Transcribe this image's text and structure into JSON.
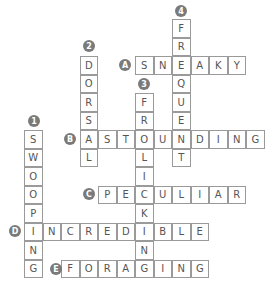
{
  "puzzle": {
    "grid": {
      "origin_x": 24,
      "origin_y": 19,
      "cell_size": 18.5
    },
    "colors": {
      "cell_border": "#9a9a9a",
      "letter": "#555555",
      "badge_bg": "#7a7a7a",
      "badge_text": "#ffffff"
    },
    "down": [
      {
        "label": "1",
        "word": "SWOOPING",
        "col": 0,
        "row": 6,
        "badge": {
          "x": 34,
          "y": 121
        }
      },
      {
        "label": "2",
        "word": "DORSAL",
        "col": 3,
        "row": 2,
        "badge": {
          "x": 89,
          "y": 46
        }
      },
      {
        "label": "3",
        "word": "FROLICKING",
        "col": 6,
        "row": 4,
        "badge": {
          "x": 144,
          "y": 84
        }
      },
      {
        "label": "4",
        "word": "FREQUENT",
        "col": 8,
        "row": 0,
        "badge": {
          "x": 181,
          "y": 11
        }
      }
    ],
    "across": [
      {
        "label": "A",
        "word": "SNEAKY",
        "col": 6,
        "row": 2,
        "badge": {
          "x": 125,
          "y": 65
        }
      },
      {
        "label": "B",
        "word": "ASTOUNDING",
        "col": 3,
        "row": 6,
        "badge": {
          "x": 70,
          "y": 139
        }
      },
      {
        "label": "C",
        "word": "PECULIAR",
        "col": 4,
        "row": 9,
        "badge": {
          "x": 89,
          "y": 194
        }
      },
      {
        "label": "D",
        "word": "INCREDIBLE",
        "col": 0,
        "row": 11,
        "badge": {
          "x": 15,
          "y": 231
        }
      },
      {
        "label": "E",
        "word": "FORAGING",
        "col": 2,
        "row": 13,
        "badge": {
          "x": 56,
          "y": 269
        }
      }
    ]
  }
}
